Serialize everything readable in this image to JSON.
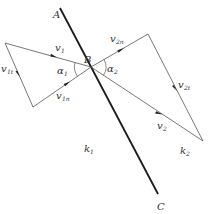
{
  "diagram": {
    "type": "vector-refraction",
    "colors": {
      "boundary": "#1a1a1a",
      "vectors": "#555555",
      "text": "#333333",
      "background": "#ffffff"
    },
    "boundary": {
      "label_start": "A",
      "label_end": "C",
      "from": [
        60,
        8
      ],
      "to": [
        158,
        194
      ]
    },
    "point": {
      "label": "B",
      "pos": [
        91,
        67
      ]
    },
    "regions": [
      {
        "label": "k",
        "sub": "1",
        "pos": [
          86,
          152
        ]
      },
      {
        "label": "k",
        "sub": "2",
        "pos": [
          180,
          154
        ]
      }
    ],
    "vectors": [
      {
        "id": "v1",
        "label": "v",
        "sub": "1",
        "from": [
          5,
          43
        ],
        "to": [
          91,
          67
        ]
      },
      {
        "id": "v1t",
        "label": "v",
        "sub": "1t",
        "from": [
          5,
          43
        ],
        "to": [
          33,
          107
        ]
      },
      {
        "id": "v1n",
        "label": "v",
        "sub": "1n",
        "from": [
          33,
          107
        ],
        "to": [
          91,
          67
        ]
      },
      {
        "id": "v2n",
        "label": "v",
        "sub": "2n",
        "from": [
          91,
          67
        ],
        "to": [
          148,
          34
        ]
      },
      {
        "id": "v2t",
        "label": "v",
        "sub": "2t",
        "from": [
          148,
          34
        ],
        "to": [
          203,
          141
        ]
      },
      {
        "id": "v2",
        "label": "v",
        "sub": "2",
        "from": [
          91,
          67
        ],
        "to": [
          203,
          141
        ]
      }
    ],
    "angles": [
      {
        "label": "α",
        "sub": "1"
      },
      {
        "label": "α",
        "sub": "2"
      }
    ]
  }
}
